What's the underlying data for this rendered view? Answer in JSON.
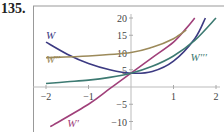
{
  "exercise_number": "135.",
  "chart_data": {
    "type": "line",
    "title": "",
    "xlabel": "",
    "ylabel": "",
    "xlim": [
      -2,
      2
    ],
    "ylim": [
      -10,
      20
    ],
    "x_ticks": [
      "-2",
      "-1",
      "1",
      "2"
    ],
    "y_ticks": [
      "20",
      "15",
      "10",
      "5",
      "-5",
      "-10"
    ],
    "grid": false,
    "series": [
      {
        "name": "W",
        "color": "#3c3a82",
        "points": [
          [
            -2,
            13
          ],
          [
            -1.5,
            9.5
          ],
          [
            -1,
            6.8
          ],
          [
            -0.5,
            5
          ],
          [
            0,
            4
          ],
          [
            0.5,
            4.5
          ],
          [
            1,
            7.5
          ],
          [
            1.5,
            14
          ],
          [
            1.75,
            20
          ]
        ]
      },
      {
        "name": "W'",
        "color": "#a0407a",
        "points": [
          [
            -1.9,
            -11.5
          ],
          [
            -1,
            -5
          ],
          [
            -0.5,
            -0.5
          ],
          [
            0,
            4
          ],
          [
            0.5,
            8.5
          ],
          [
            1,
            13
          ],
          [
            1.3,
            17
          ],
          [
            1.5,
            20
          ]
        ]
      },
      {
        "name": "W''",
        "color": "#9c8a5a",
        "points": [
          [
            -2,
            8.5
          ],
          [
            -1,
            9
          ],
          [
            0,
            10
          ],
          [
            0.5,
            11.5
          ],
          [
            1,
            14
          ],
          [
            1.3,
            16.5
          ]
        ]
      },
      {
        "name": "W'''",
        "color": "#3d7a72",
        "points": [
          [
            -2,
            1
          ],
          [
            -1.5,
            1.5
          ],
          [
            -1,
            2
          ],
          [
            -0.5,
            2.8
          ],
          [
            0,
            4
          ],
          [
            0.5,
            6
          ],
          [
            1,
            9
          ],
          [
            1.5,
            13.5
          ],
          [
            2,
            20
          ]
        ]
      }
    ],
    "labels": [
      {
        "text": "W",
        "x": -2,
        "y": 14
      },
      {
        "text": "W'",
        "x": -1.5,
        "y": -11.5
      },
      {
        "text": "W''",
        "x": -2,
        "y": 7
      },
      {
        "text": "W'''",
        "x": 1.4,
        "y": 7.5
      }
    ]
  }
}
